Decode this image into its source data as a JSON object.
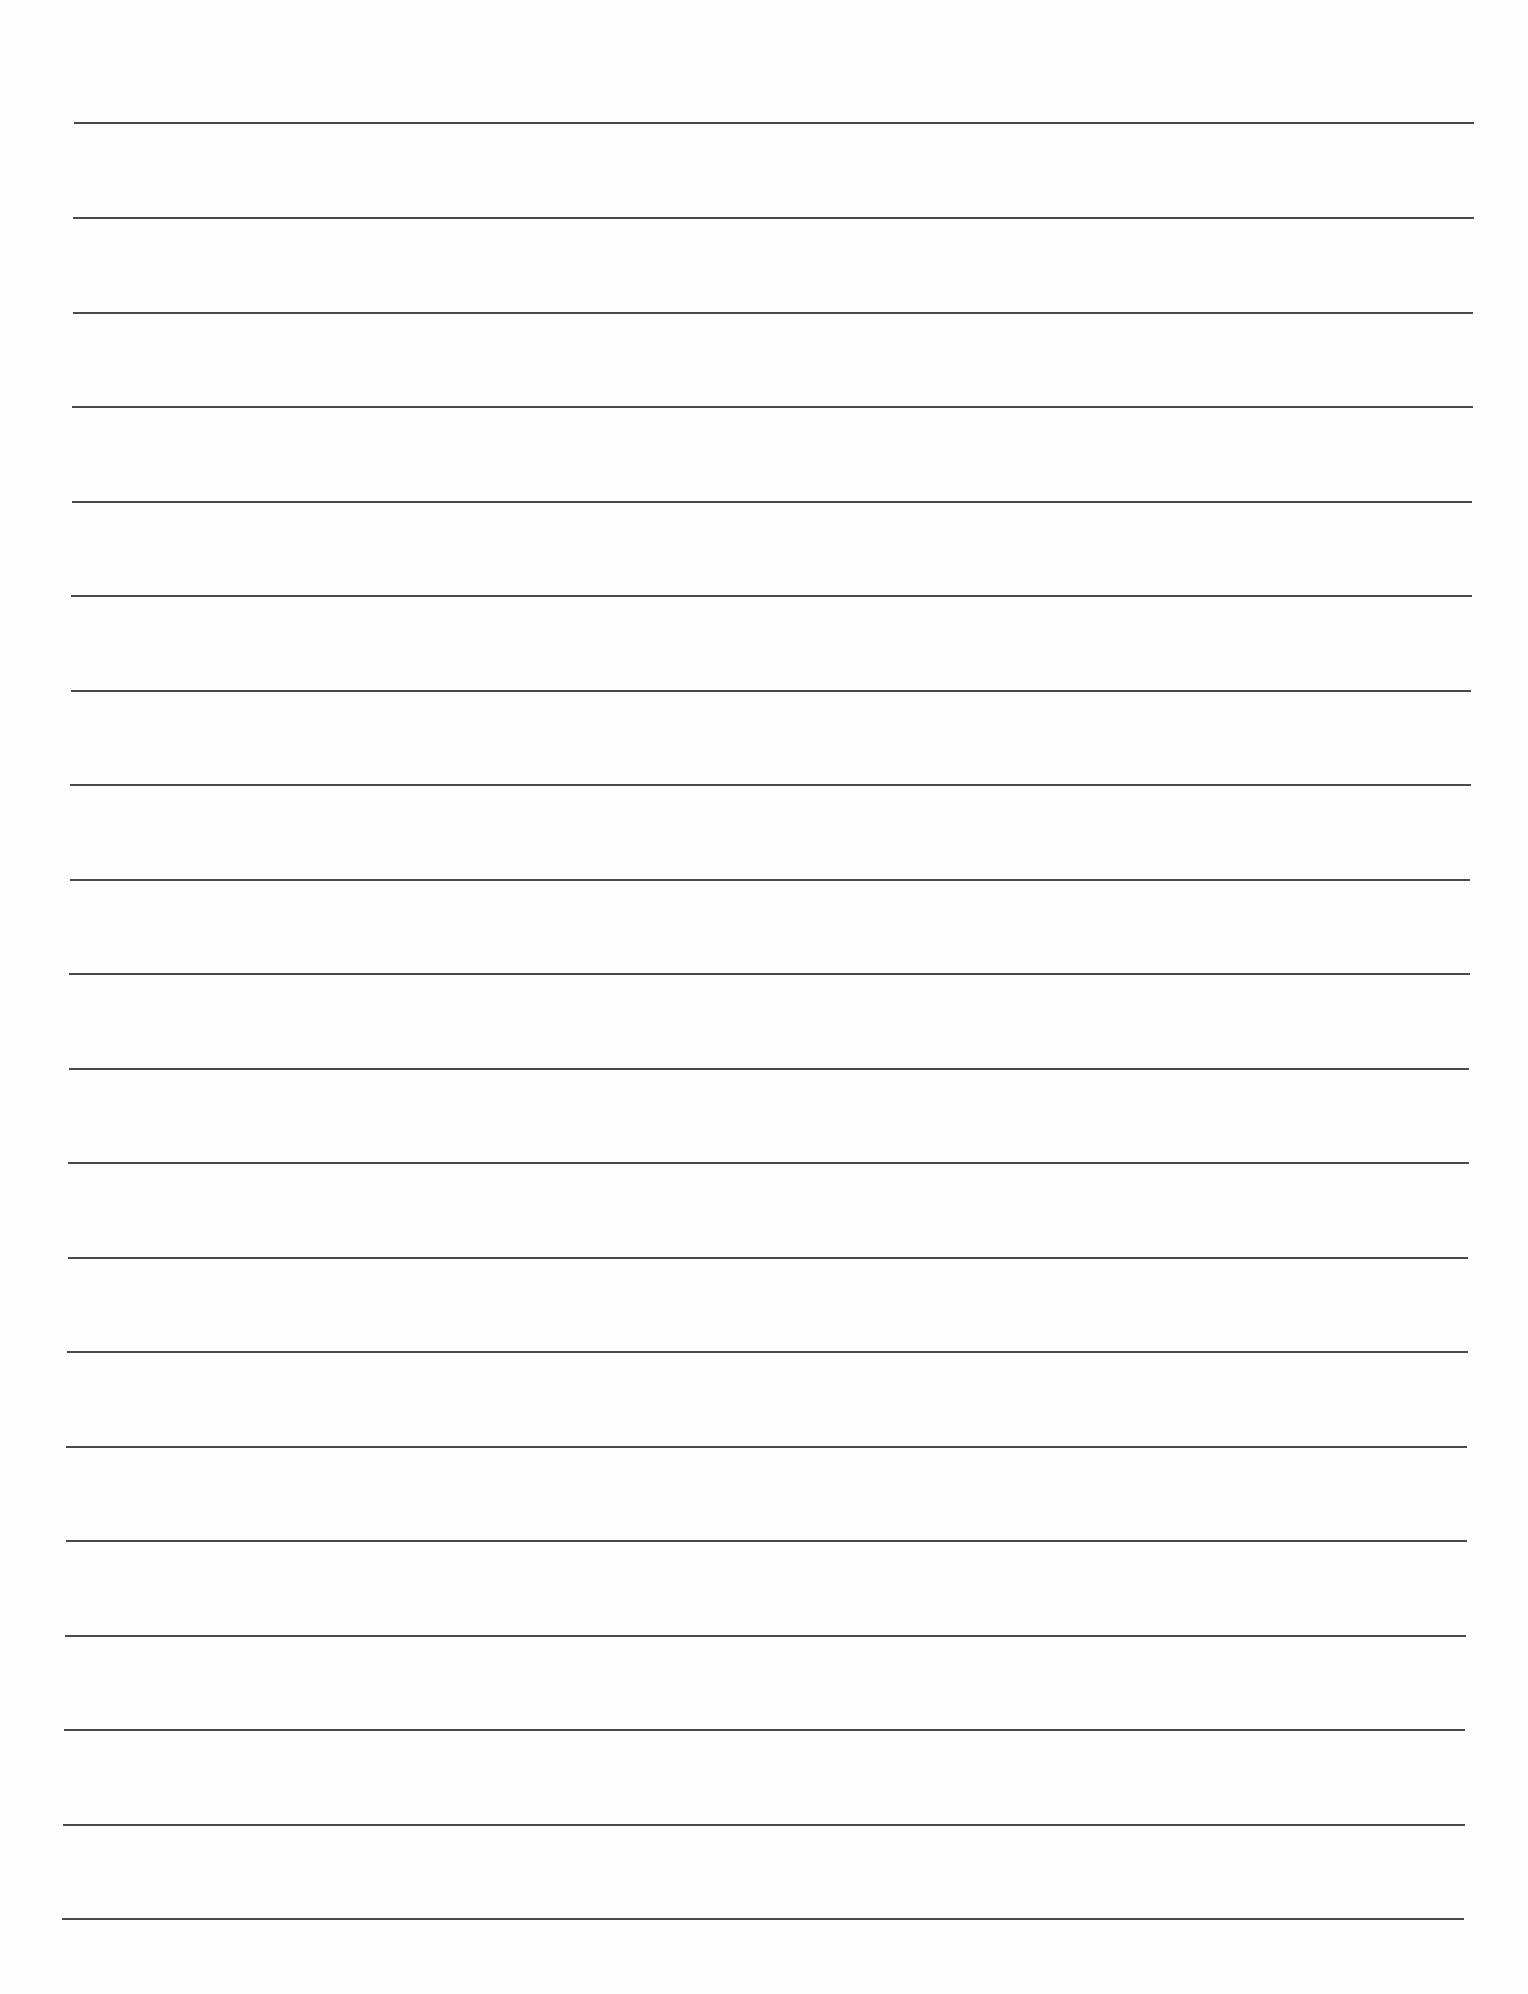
{
  "document": {
    "type": "lined-paper",
    "background_color": "#fefefe",
    "line_color": "#4a4a4a",
    "line_count": 20,
    "lines": [
      {
        "y": 123,
        "x1": 74,
        "x2": 1474
      },
      {
        "y": 218,
        "x1": 73,
        "x2": 1474
      },
      {
        "y": 313,
        "x1": 73,
        "x2": 1473
      },
      {
        "y": 407,
        "x1": 72,
        "x2": 1473
      },
      {
        "y": 502,
        "x1": 72,
        "x2": 1472
      },
      {
        "y": 596,
        "x1": 71,
        "x2": 1472
      },
      {
        "y": 691,
        "x1": 71,
        "x2": 1471
      },
      {
        "y": 785,
        "x1": 70,
        "x2": 1471
      },
      {
        "y": 880,
        "x1": 70,
        "x2": 1470
      },
      {
        "y": 974,
        "x1": 69,
        "x2": 1470
      },
      {
        "y": 1069,
        "x1": 69,
        "x2": 1469
      },
      {
        "y": 1163,
        "x1": 68,
        "x2": 1469
      },
      {
        "y": 1258,
        "x1": 68,
        "x2": 1468
      },
      {
        "y": 1352,
        "x1": 67,
        "x2": 1468
      },
      {
        "y": 1447,
        "x1": 66,
        "x2": 1467
      },
      {
        "y": 1541,
        "x1": 66,
        "x2": 1467
      },
      {
        "y": 1636,
        "x1": 65,
        "x2": 1466
      },
      {
        "y": 1730,
        "x1": 64,
        "x2": 1465
      },
      {
        "y": 1825,
        "x1": 63,
        "x2": 1465
      },
      {
        "y": 1919,
        "x1": 62,
        "x2": 1464
      }
    ]
  }
}
